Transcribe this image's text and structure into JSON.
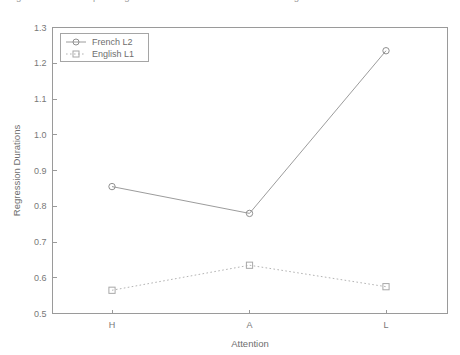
{
  "caption": {
    "text": "Figure 7. Mean first-pass regression durations for French L2 and English L1 readers"
  },
  "chart_data": {
    "type": "line",
    "title": "",
    "xlabel": "Attention",
    "ylabel": "Regression Durations",
    "categories": [
      "H",
      "A",
      "L"
    ],
    "series": [
      {
        "name": "French L2",
        "values": [
          0.855,
          0.78,
          1.235
        ],
        "marker": "circle",
        "linestyle": "solid",
        "color": "#9c9c9c"
      },
      {
        "name": "English L1",
        "values": [
          0.565,
          0.635,
          0.575
        ],
        "marker": "square",
        "linestyle": "dotted",
        "color": "#b4b4b4"
      }
    ],
    "ylim": [
      0.5,
      1.3
    ],
    "ytick_labels": [
      "0.5",
      "0.6",
      "0.7",
      "0.8",
      "0.9",
      "1.0",
      "1.1",
      "1.2",
      "1.3"
    ],
    "ytick_values": [
      0.5,
      0.6,
      0.7,
      0.8,
      0.9,
      1.0,
      1.1,
      1.2,
      1.3
    ],
    "xtick_labels": [
      "H",
      "A",
      "L"
    ],
    "grid": false,
    "legend_position": "top-left",
    "legend_entries": [
      "French L2",
      "English L1"
    ]
  }
}
